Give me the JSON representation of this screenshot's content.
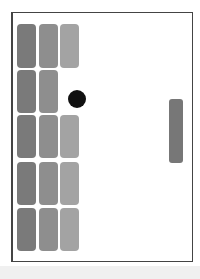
{
  "game": {
    "type": "breakout",
    "orientation": "horizontal",
    "colors": {
      "col1": "#7a7a7a",
      "col2": "#8e8e8e",
      "col3": "#a3a3a3",
      "paddle": "#777777",
      "ball": "#111111",
      "frame": "#444444"
    },
    "bricks": [
      {
        "row": 0,
        "col": 0,
        "x": 17,
        "y": 24,
        "w": 19,
        "h": 44
      },
      {
        "row": 0,
        "col": 1,
        "x": 39,
        "y": 24,
        "w": 19,
        "h": 44
      },
      {
        "row": 0,
        "col": 2,
        "x": 60,
        "y": 24,
        "w": 19,
        "h": 44
      },
      {
        "row": 1,
        "col": 0,
        "x": 17,
        "y": 70,
        "w": 19,
        "h": 43
      },
      {
        "row": 1,
        "col": 1,
        "x": 39,
        "y": 70,
        "w": 19,
        "h": 43
      },
      {
        "row": 2,
        "col": 0,
        "x": 17,
        "y": 115,
        "w": 19,
        "h": 43
      },
      {
        "row": 2,
        "col": 1,
        "x": 39,
        "y": 115,
        "w": 19,
        "h": 43
      },
      {
        "row": 2,
        "col": 2,
        "x": 60,
        "y": 115,
        "w": 19,
        "h": 43
      },
      {
        "row": 3,
        "col": 0,
        "x": 17,
        "y": 162,
        "w": 19,
        "h": 43
      },
      {
        "row": 3,
        "col": 1,
        "x": 39,
        "y": 162,
        "w": 19,
        "h": 43
      },
      {
        "row": 3,
        "col": 2,
        "x": 60,
        "y": 162,
        "w": 19,
        "h": 43
      },
      {
        "row": 4,
        "col": 0,
        "x": 17,
        "y": 208,
        "w": 19,
        "h": 43
      },
      {
        "row": 4,
        "col": 1,
        "x": 39,
        "y": 208,
        "w": 19,
        "h": 43
      },
      {
        "row": 4,
        "col": 2,
        "x": 60,
        "y": 208,
        "w": 19,
        "h": 43
      }
    ],
    "ball": {
      "cx": 77,
      "cy": 99,
      "r": 9
    },
    "paddle": {
      "x": 169,
      "y": 99,
      "w": 14,
      "h": 64
    }
  }
}
